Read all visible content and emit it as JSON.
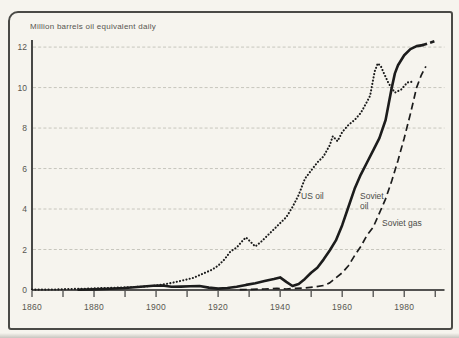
{
  "colors": {
    "paper": "#f6f4ee",
    "line": "#1c1c1c",
    "gridline": "#c7c6bd",
    "label_text": "#565650",
    "frame_border": "#4a4a46"
  },
  "annotations": {
    "us_oil": "US oil",
    "soviet_oil_line1": "Soviet",
    "soviet_oil_line2": "oil",
    "soviet_gas": "Soviet gas"
  },
  "chart_data": {
    "type": "line",
    "title": "Million barrels oil equivalent daily",
    "xlabel": "",
    "ylabel": "Million barrels oil equivalent daily",
    "legend_position": "inline-labels",
    "grid": "horizontal-dashed",
    "x_axis": {
      "range": [
        1860,
        1993
      ],
      "ticks": [
        1860,
        1870,
        1880,
        1890,
        1900,
        1910,
        1920,
        1930,
        1940,
        1950,
        1960,
        1970,
        1980,
        1990
      ],
      "labeled_ticks": [
        1860,
        1880,
        1900,
        1920,
        1940,
        1960,
        1980
      ]
    },
    "y_axis": {
      "range": [
        0,
        12.35
      ],
      "ticks": [
        0,
        2,
        4,
        6,
        8,
        10,
        12
      ]
    },
    "series": [
      {
        "name": "US oil",
        "style": "dotted",
        "points": [
          [
            1860,
            0.02
          ],
          [
            1864,
            0.02
          ],
          [
            1868,
            0.03
          ],
          [
            1872,
            0.05
          ],
          [
            1876,
            0.06
          ],
          [
            1880,
            0.08
          ],
          [
            1884,
            0.1
          ],
          [
            1888,
            0.12
          ],
          [
            1892,
            0.14
          ],
          [
            1896,
            0.17
          ],
          [
            1900,
            0.22
          ],
          [
            1904,
            0.32
          ],
          [
            1908,
            0.45
          ],
          [
            1912,
            0.6
          ],
          [
            1915,
            0.8
          ],
          [
            1918,
            1.0
          ],
          [
            1920,
            1.2
          ],
          [
            1922,
            1.5
          ],
          [
            1924,
            1.9
          ],
          [
            1926,
            2.1
          ],
          [
            1928,
            2.45
          ],
          [
            1929,
            2.6
          ],
          [
            1930,
            2.45
          ],
          [
            1932,
            2.15
          ],
          [
            1934,
            2.4
          ],
          [
            1936,
            2.7
          ],
          [
            1938,
            3.0
          ],
          [
            1940,
            3.3
          ],
          [
            1942,
            3.6
          ],
          [
            1944,
            4.1
          ],
          [
            1946,
            4.7
          ],
          [
            1948,
            5.5
          ],
          [
            1950,
            5.9
          ],
          [
            1952,
            6.3
          ],
          [
            1954,
            6.6
          ],
          [
            1956,
            7.15
          ],
          [
            1957,
            7.6
          ],
          [
            1958.5,
            7.35
          ],
          [
            1960,
            7.8
          ],
          [
            1962,
            8.15
          ],
          [
            1964,
            8.4
          ],
          [
            1966,
            8.75
          ],
          [
            1968,
            9.3
          ],
          [
            1969,
            9.6
          ],
          [
            1970.5,
            10.8
          ],
          [
            1971.5,
            11.2
          ],
          [
            1972.5,
            11.05
          ],
          [
            1973.5,
            10.7
          ],
          [
            1975,
            10.2
          ],
          [
            1977,
            9.75
          ],
          [
            1979,
            9.9
          ],
          [
            1981,
            10.25
          ],
          [
            1983,
            10.3
          ]
        ]
      },
      {
        "name": "Soviet oil",
        "style": "solid",
        "points": [
          [
            1875,
            0.01
          ],
          [
            1880,
            0.03
          ],
          [
            1885,
            0.06
          ],
          [
            1890,
            0.1
          ],
          [
            1895,
            0.16
          ],
          [
            1899,
            0.21
          ],
          [
            1902,
            0.22
          ],
          [
            1905,
            0.16
          ],
          [
            1908,
            0.17
          ],
          [
            1911,
            0.19
          ],
          [
            1914,
            0.2
          ],
          [
            1917,
            0.12
          ],
          [
            1920,
            0.07
          ],
          [
            1923,
            0.1
          ],
          [
            1926,
            0.16
          ],
          [
            1929,
            0.25
          ],
          [
            1932,
            0.33
          ],
          [
            1935,
            0.44
          ],
          [
            1938,
            0.54
          ],
          [
            1940,
            0.62
          ],
          [
            1942,
            0.4
          ],
          [
            1944,
            0.2
          ],
          [
            1946,
            0.3
          ],
          [
            1948,
            0.55
          ],
          [
            1950,
            0.85
          ],
          [
            1952,
            1.1
          ],
          [
            1954,
            1.5
          ],
          [
            1956,
            1.95
          ],
          [
            1958,
            2.45
          ],
          [
            1960,
            3.2
          ],
          [
            1962,
            4.1
          ],
          [
            1964,
            5.0
          ],
          [
            1966,
            5.7
          ],
          [
            1968,
            6.3
          ],
          [
            1970,
            6.9
          ],
          [
            1972,
            7.5
          ],
          [
            1974,
            8.4
          ],
          [
            1975,
            9.2
          ],
          [
            1976,
            10.0
          ],
          [
            1977,
            10.7
          ],
          [
            1978,
            11.1
          ],
          [
            1980,
            11.6
          ],
          [
            1982,
            11.9
          ],
          [
            1984,
            12.05
          ],
          [
            1986,
            12.1
          ]
        ]
      },
      {
        "name": "Soviet oil projection",
        "style": "projection",
        "points": [
          [
            1986,
            12.1
          ],
          [
            1988,
            12.2
          ],
          [
            1990,
            12.3
          ]
        ]
      },
      {
        "name": "Soviet gas",
        "style": "dashed",
        "points": [
          [
            1927,
            0.02
          ],
          [
            1931,
            0.03
          ],
          [
            1935,
            0.05
          ],
          [
            1939,
            0.08
          ],
          [
            1942,
            0.05
          ],
          [
            1945,
            0.08
          ],
          [
            1948,
            0.1
          ],
          [
            1951,
            0.15
          ],
          [
            1954,
            0.22
          ],
          [
            1956,
            0.35
          ],
          [
            1958,
            0.6
          ],
          [
            1960,
            0.85
          ],
          [
            1962,
            1.2
          ],
          [
            1964,
            1.7
          ],
          [
            1966,
            2.15
          ],
          [
            1968,
            2.7
          ],
          [
            1970,
            3.1
          ],
          [
            1972,
            3.8
          ],
          [
            1974,
            4.5
          ],
          [
            1976,
            5.4
          ],
          [
            1978,
            6.4
          ],
          [
            1980,
            7.5
          ],
          [
            1982,
            8.7
          ],
          [
            1984,
            10.0
          ],
          [
            1985.5,
            10.6
          ],
          [
            1987,
            11.05
          ]
        ]
      }
    ]
  }
}
